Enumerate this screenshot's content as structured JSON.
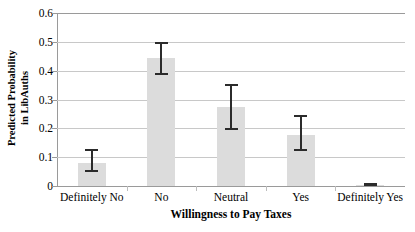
{
  "chart_data": {
    "type": "bar",
    "title": "",
    "xlabel": "Willingness to Pay Taxes",
    "ylabel": "Predicted Probability in LibAuths",
    "ylabel_line1": "Predicted Probability",
    "ylabel_line2": "in LibAuths",
    "categories": [
      "Definitely No",
      "No",
      "Neutral",
      "Yes",
      "Definitely Yes"
    ],
    "values": [
      0.08,
      0.443,
      0.275,
      0.178,
      0.003
    ],
    "error_low": [
      0.047,
      0.385,
      0.195,
      0.123,
      0.0
    ],
    "error_high": [
      0.13,
      0.5,
      0.355,
      0.245,
      0.012
    ],
    "ylim": [
      0,
      0.6
    ],
    "ytick_values": [
      0,
      0.1,
      0.2,
      0.3,
      0.4,
      0.5,
      0.6
    ],
    "ytick_labels": [
      "0",
      "0.1",
      "0.2",
      "0.3",
      "0.4",
      "0.5",
      "0.6"
    ],
    "grid": true,
    "grid_axis": "y",
    "legend": false,
    "legend_position": "none",
    "bar_color": "#dcdcdc",
    "errorbar_color": "#2b2b2b",
    "gridline_color": "#c8c8c8",
    "axis_color": "#9a9a9a"
  }
}
